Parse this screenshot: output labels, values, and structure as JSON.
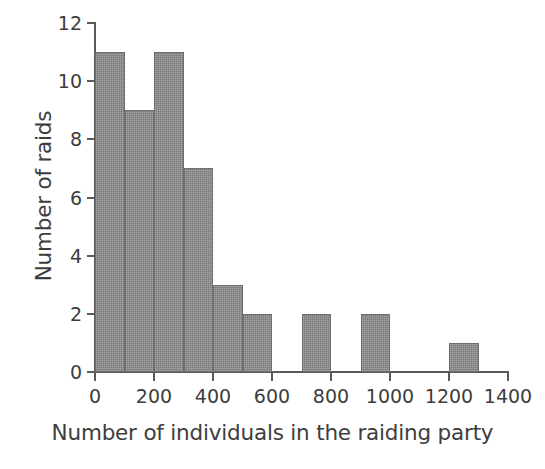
{
  "chart_data": {
    "type": "bar",
    "subtype": "histogram",
    "title": "",
    "xlabel": "Number of individuals in the raiding party",
    "ylabel": "Number of raids",
    "xlim": [
      0,
      1400
    ],
    "ylim": [
      0,
      12
    ],
    "bin_width": 100,
    "grid": false,
    "legend": null,
    "bar_color": "#8a8a8a",
    "bar_edge_color": "#6e6e6e",
    "axis_color": "#5a5a5a",
    "text_color": "#3d3d3d",
    "background_color": "#ffffff",
    "xticks": [
      0,
      200,
      400,
      600,
      800,
      1000,
      1200,
      1400
    ],
    "xtick_labels": [
      "0",
      "200",
      "400",
      "600",
      "800",
      "1000",
      "1200",
      "1400"
    ],
    "yticks": [
      0,
      2,
      4,
      6,
      8,
      10,
      12
    ],
    "ytick_labels": [
      "0",
      "2",
      "4",
      "6",
      "8",
      "10",
      "12"
    ],
    "categories": [
      "0-100",
      "100-200",
      "200-300",
      "300-400",
      "400-500",
      "500-600",
      "600-700",
      "700-800",
      "800-900",
      "900-1000",
      "1000-1100",
      "1100-1200",
      "1200-1300",
      "1300-1400"
    ],
    "bins": [
      {
        "x0": 0,
        "x1": 100,
        "value": 11
      },
      {
        "x0": 100,
        "x1": 200,
        "value": 9
      },
      {
        "x0": 200,
        "x1": 300,
        "value": 11
      },
      {
        "x0": 300,
        "x1": 400,
        "value": 7
      },
      {
        "x0": 400,
        "x1": 500,
        "value": 3
      },
      {
        "x0": 500,
        "x1": 600,
        "value": 2
      },
      {
        "x0": 600,
        "x1": 700,
        "value": 0
      },
      {
        "x0": 700,
        "x1": 800,
        "value": 2
      },
      {
        "x0": 800,
        "x1": 900,
        "value": 0
      },
      {
        "x0": 900,
        "x1": 1000,
        "value": 2
      },
      {
        "x0": 1000,
        "x1": 1100,
        "value": 0
      },
      {
        "x0": 1100,
        "x1": 1200,
        "value": 0
      },
      {
        "x0": 1200,
        "x1": 1300,
        "value": 1
      },
      {
        "x0": 1300,
        "x1": 1400,
        "value": 0
      }
    ],
    "values": [
      11,
      9,
      11,
      7,
      3,
      2,
      0,
      2,
      0,
      2,
      0,
      0,
      1,
      0
    ]
  }
}
